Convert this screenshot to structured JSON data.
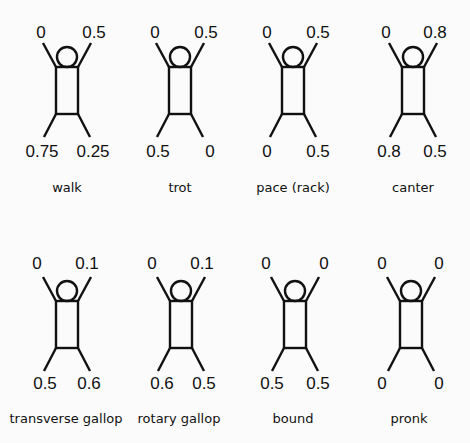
{
  "layout": {
    "columns": [
      67,
      180,
      293,
      406
    ],
    "rows": [
      0,
      234
    ]
  },
  "gaits": [
    {
      "name": "walk",
      "phases": {
        "left_fore": "0",
        "right_fore": "0.5",
        "left_hind": "0.75",
        "right_hind": "0.25"
      }
    },
    {
      "name": "trot",
      "phases": {
        "left_fore": "0",
        "right_fore": "0.5",
        "left_hind": "0.5",
        "right_hind": "0"
      }
    },
    {
      "name": "pace (rack)",
      "phases": {
        "left_fore": "0",
        "right_fore": "0.5",
        "left_hind": "0",
        "right_hind": "0.5"
      }
    },
    {
      "name": "canter",
      "phases": {
        "left_fore": "0",
        "right_fore": "0.8",
        "left_hind": "0.8",
        "right_hind": "0.5"
      }
    },
    {
      "name": "transverse gallop",
      "phases": {
        "left_fore": "0",
        "right_fore": "0.1",
        "left_hind": "0.5",
        "right_hind": "0.6"
      }
    },
    {
      "name": "rotary gallop",
      "phases": {
        "left_fore": "0",
        "right_fore": "0.1",
        "left_hind": "0.6",
        "right_hind": "0.5"
      }
    },
    {
      "name": "bound",
      "phases": {
        "left_fore": "0",
        "right_fore": "0",
        "left_hind": "0.5",
        "right_hind": "0.5"
      }
    },
    {
      "name": "pronk",
      "phases": {
        "left_fore": "0",
        "right_fore": "0",
        "left_hind": "0",
        "right_hind": "0"
      }
    }
  ]
}
